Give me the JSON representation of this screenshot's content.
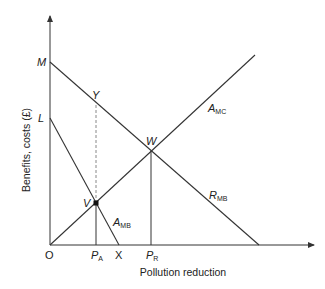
{
  "diagram": {
    "y_axis_label": "Benefits, costs (£)",
    "x_axis_label": "Pollution reduction",
    "origin_label": "O",
    "points": {
      "M": "M",
      "L": "L",
      "Y": "Y",
      "W": "W",
      "V": "V",
      "X": "X"
    },
    "tick_labels": {
      "PA_main": "P",
      "PA_sub": "A",
      "PR_main": "P",
      "PR_sub": "R"
    },
    "curves": {
      "AMC_main": "A",
      "AMC_sub": "MC",
      "RMB_main": "R",
      "RMB_sub": "MB",
      "AMB_main": "A",
      "AMB_sub": "MB"
    },
    "colors": {
      "line": "#333333",
      "dashed": "#888888"
    }
  }
}
